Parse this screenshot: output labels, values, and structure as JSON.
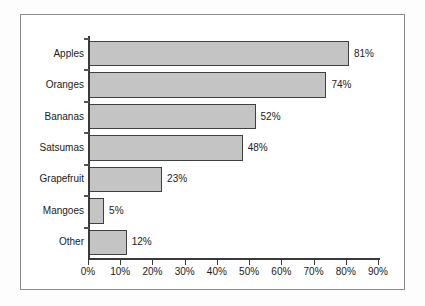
{
  "chart_data": {
    "type": "bar",
    "orientation": "horizontal",
    "title": "",
    "xlabel": "",
    "ylabel": "",
    "categories": [
      "Apples",
      "Oranges",
      "Bananas",
      "Satsumas",
      "Grapefruit",
      "Mangoes",
      "Other"
    ],
    "values": [
      81,
      74,
      52,
      48,
      23,
      5,
      12
    ],
    "value_labels": [
      "81%",
      "74%",
      "52%",
      "48%",
      "23%",
      "5%",
      "12%"
    ],
    "xlim": [
      0,
      90
    ],
    "xticks": [
      0,
      10,
      20,
      30,
      40,
      50,
      60,
      70,
      80,
      90
    ],
    "xtick_labels": [
      "0%",
      "10%",
      "20%",
      "30%",
      "40%",
      "50%",
      "60%",
      "70%",
      "80%",
      "90%"
    ],
    "grid": false,
    "legend": null,
    "colors": {
      "bar_fill": "#c4c4c4",
      "bar_edge": "#404040",
      "axis": "#3a3a3a",
      "frame": "#8a8a8a",
      "text": "#1a1a1a",
      "background": "#ffffff"
    }
  }
}
